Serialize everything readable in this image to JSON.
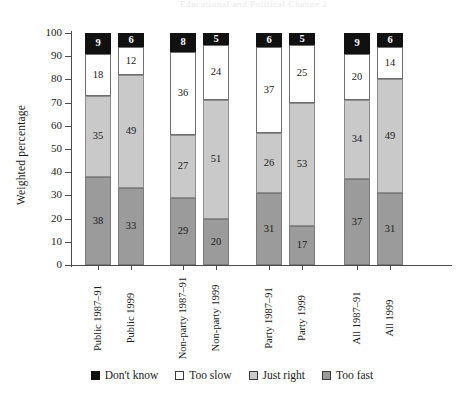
{
  "running_head": {
    "text": "Educational and Political Change   2",
    "note": "cropped running head at top edge, nearly illegible"
  },
  "chart_data": {
    "type": "bar",
    "stacked": true,
    "title": "",
    "xlabel": "",
    "ylabel": "Weighted percentage",
    "ylim": [
      0,
      100
    ],
    "yticks": [
      0,
      10,
      20,
      30,
      40,
      50,
      60,
      70,
      80,
      90,
      100
    ],
    "grid": false,
    "legend_position": "bottom",
    "categories": [
      "Public 1987–91",
      "Public 1999",
      "Non-party 1987–91",
      "Non-party 1999",
      "Party 1987–91",
      "Party 1999",
      "All 1987–91",
      "All 1999"
    ],
    "group_breaks": [
      2,
      4,
      6
    ],
    "series": [
      {
        "name": "Too fast",
        "color": "#9b9b9b",
        "values": [
          38,
          33,
          29,
          20,
          31,
          17,
          37,
          31
        ]
      },
      {
        "name": "Just right",
        "color": "#c9c9c9",
        "values": [
          35,
          49,
          27,
          51,
          26,
          53,
          34,
          49
        ]
      },
      {
        "name": "Too slow",
        "color": "#ffffff",
        "values": [
          18,
          12,
          36,
          24,
          37,
          25,
          20,
          14
        ]
      },
      {
        "name": "Don't know",
        "color": "#111111",
        "values": [
          9,
          6,
          8,
          5,
          6,
          5,
          9,
          6
        ]
      }
    ]
  },
  "legend": {
    "items": [
      {
        "label": "Don't know",
        "swatch": "black-square-icon",
        "key": "dk"
      },
      {
        "label": "Too slow",
        "swatch": "white-square-icon",
        "key": "slow"
      },
      {
        "label": "Just right",
        "swatch": "light-gray-square-icon",
        "key": "right"
      },
      {
        "label": "Too fast",
        "swatch": "dark-gray-square-icon",
        "key": "fast"
      }
    ]
  },
  "colors": {
    "dont_know": "#111111",
    "too_slow": "#ffffff",
    "just_right": "#c9c9c9",
    "too_fast": "#9b9b9b",
    "axis": "#4a4a4a",
    "text": "#1a1a1a",
    "background": "#ffffff"
  }
}
